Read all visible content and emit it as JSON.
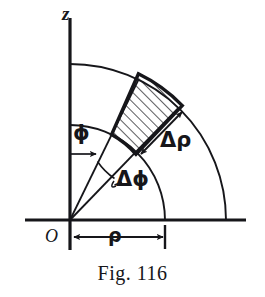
{
  "figure": {
    "caption": "Fig. 116",
    "ink_color": "#16161a",
    "background_color": "#ffffff",
    "labels": {
      "z_axis": "z",
      "origin": "O",
      "phi": "ϕ",
      "rho": "ρ",
      "delta_rho": "Δρ",
      "delta_phi": "Δϕ"
    },
    "geometry": {
      "origin_x": 70,
      "origin_y": 220,
      "inner_radius": 95,
      "outer_radius": 156,
      "phi_start_deg_from_z": 26,
      "phi_end_deg_from_z": 44,
      "z_axis_top_y": 18,
      "z_axis_bottom_y": 250,
      "x_axis_left_x": 25,
      "x_axis_right_x": 246,
      "x_axis_y": 220,
      "rho_dimension_y": 237,
      "rho_dimension_from_x": 72,
      "rho_dimension_to_x": 165
    },
    "cell": {
      "hatched": true,
      "hatch_angle_deg": 45,
      "description": "volume element bounded by two radial lines and two arcs"
    }
  }
}
